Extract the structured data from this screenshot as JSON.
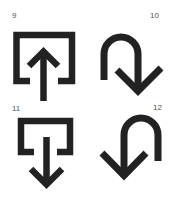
{
  "icons": [
    {
      "number": "9",
      "name": "share-upload-arrow",
      "description": "open box with arrow pointing up out of it"
    },
    {
      "number": "10",
      "name": "u-turn-down-right",
      "description": "hooked arrow curving over and pointing down-right"
    },
    {
      "number": "11",
      "name": "download-into-box-arrow",
      "description": "open box with arrow pointing down out of it"
    },
    {
      "number": "12",
      "name": "u-turn-down-left",
      "description": "hooked arrow curving over and pointing down-left"
    }
  ],
  "colors": {
    "stroke": "#222222",
    "label": "#555555",
    "background": "#ffffff"
  }
}
